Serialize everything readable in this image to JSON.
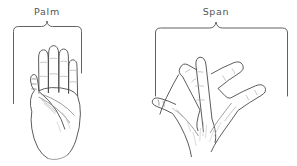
{
  "figure": {
    "type": "line-drawing-diagram",
    "background_color": "#ffffff",
    "ink_color": "#4a4a4a",
    "label_color": "#555555",
    "panels": [
      {
        "id": "palm",
        "label": "Palm",
        "label_position": "top-center",
        "bracket": "curly-brace-down",
        "hand_pose": "fingers-together-palm-open",
        "fingers": 4,
        "thumb": 1
      },
      {
        "id": "span",
        "label": "Span",
        "label_position": "top-center",
        "bracket": "curly-brace-down",
        "hand_pose": "fingers-spread-splayed",
        "fingers": 4,
        "thumb": 1
      }
    ]
  },
  "labels": {
    "palm": "Palm",
    "span": "Span"
  }
}
